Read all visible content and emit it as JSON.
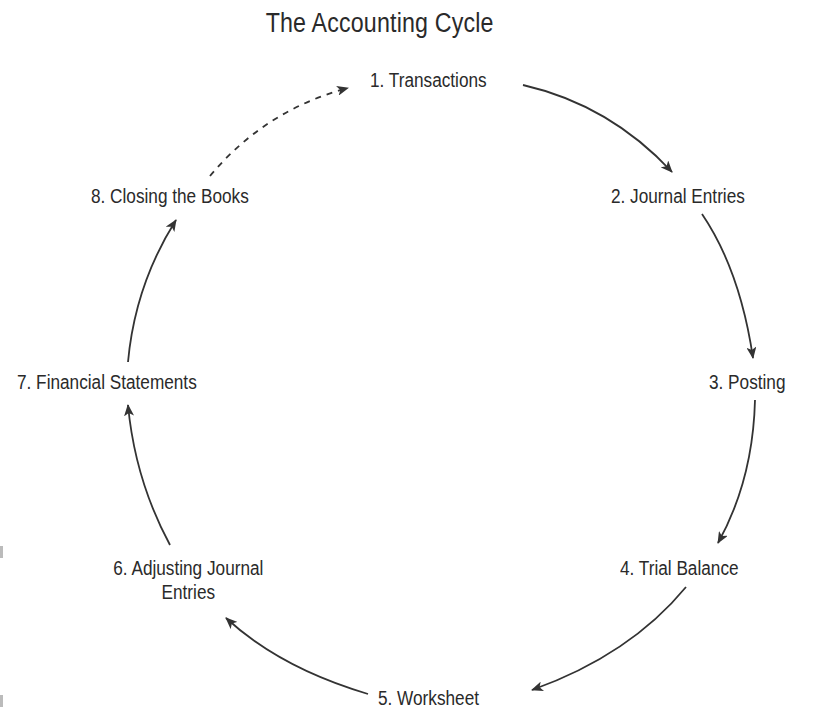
{
  "diagram": {
    "title": "The Accounting Cycle",
    "type": "cycle",
    "nodes": [
      {
        "id": 1,
        "label": "1. Transactions"
      },
      {
        "id": 2,
        "label": "2. Journal Entries"
      },
      {
        "id": 3,
        "label": "3. Posting"
      },
      {
        "id": 4,
        "label": "4. Trial Balance"
      },
      {
        "id": 5,
        "label": "5. Worksheet"
      },
      {
        "id": 6,
        "label_line1": "6. Adjusting Journal",
        "label_line2": "Entries"
      },
      {
        "id": 7,
        "label": "7. Financial Statements"
      },
      {
        "id": 8,
        "label": "8. Closing the Books"
      }
    ],
    "edges": [
      {
        "from": 1,
        "to": 2,
        "style": "solid"
      },
      {
        "from": 2,
        "to": 3,
        "style": "solid"
      },
      {
        "from": 3,
        "to": 4,
        "style": "solid"
      },
      {
        "from": 4,
        "to": 5,
        "style": "solid"
      },
      {
        "from": 5,
        "to": 6,
        "style": "solid"
      },
      {
        "from": 6,
        "to": 7,
        "style": "solid"
      },
      {
        "from": 7,
        "to": 8,
        "style": "solid"
      },
      {
        "from": 8,
        "to": 1,
        "style": "dashed"
      }
    ],
    "colors": {
      "text": "#2a2a2a",
      "arrow": "#333333",
      "background": "#ffffff"
    }
  }
}
